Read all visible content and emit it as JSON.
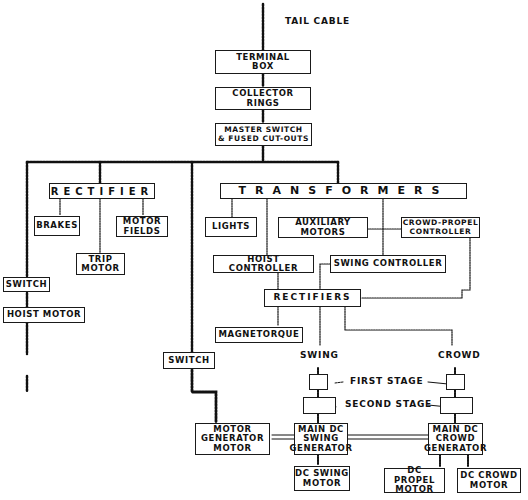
{
  "diagram": {
    "source_label": "TAIL CABLE",
    "nodes": {
      "terminal_box": "TERMINAL\nBOX",
      "collector_rings": "COLLECTOR\nRINGS",
      "master_switch": "MASTER SWITCH\n& FUSED CUT-OUTS",
      "rectifier": "RECTIFIER",
      "brakes": "BRAKES",
      "motor_fields": "MOTOR\nFIELDS",
      "trip_motor": "TRIP\nMOTOR",
      "switch_left": "SWITCH",
      "hoist_motor": "HOIST MOTOR",
      "transformers": "TRANSFORMERS",
      "lights": "LIGHTS",
      "auxiliary_motors": "AUXILIARY\nMOTORS",
      "crowd_propel_controller": "CROWD-PROPEL\nCONTROLLER",
      "hoist_controller": "HOIST CONTROLLER",
      "swing_controller": "SWING CONTROLLER",
      "rectifiers": "RECTIFIERS",
      "magnetorque": "MAGNETORQUE",
      "switch_mid": "SWITCH",
      "motor_generator_motor": "MOTOR\nGENERATOR\nMOTOR",
      "main_dc_swing_generator": "MAIN DC\nSWING\nGENERATOR",
      "main_dc_crowd_generator": "MAIN DC\nCROWD\nGENERATOR",
      "dc_swing_motor": "DC SWING\nMOTOR",
      "dc_propel_motor": "DC PROPEL\nMOTOR",
      "dc_crowd_motor": "DC CROWD\nMOTOR"
    },
    "labels": {
      "swing": "SWING",
      "crowd": "CROWD",
      "first_stage": "FIRST STAGE",
      "second_stage": "SECOND STAGE"
    },
    "edges": [
      [
        "tail_cable",
        "terminal_box"
      ],
      [
        "terminal_box",
        "collector_rings"
      ],
      [
        "collector_rings",
        "master_switch"
      ],
      [
        "master_switch",
        "rectifier"
      ],
      [
        "master_switch",
        "switch_left"
      ],
      [
        "master_switch",
        "switch_mid"
      ],
      [
        "master_switch",
        "transformers"
      ],
      [
        "rectifier",
        "brakes"
      ],
      [
        "rectifier",
        "trip_motor"
      ],
      [
        "rectifier",
        "motor_fields"
      ],
      [
        "switch_left",
        "hoist_motor"
      ],
      [
        "transformers",
        "lights"
      ],
      [
        "transformers",
        "hoist_controller"
      ],
      [
        "transformers",
        "swing_controller"
      ],
      [
        "auxiliary_motors",
        "crowd_propel_controller"
      ],
      [
        "hoist_controller",
        "rectifiers"
      ],
      [
        "swing_controller",
        "rectifiers"
      ],
      [
        "crowd_propel_controller",
        "rectifiers"
      ],
      [
        "rectifiers",
        "magnetorque"
      ],
      [
        "rectifiers",
        "swing_first_stage"
      ],
      [
        "rectifiers",
        "crowd_first_stage"
      ],
      [
        "swing_first_stage",
        "swing_second_stage"
      ],
      [
        "crowd_first_stage",
        "crowd_second_stage"
      ],
      [
        "swing_second_stage",
        "main_dc_swing_generator"
      ],
      [
        "crowd_second_stage",
        "main_dc_crowd_generator"
      ],
      [
        "switch_mid",
        "motor_generator_motor"
      ],
      [
        "motor_generator_motor",
        "main_dc_swing_generator"
      ],
      [
        "main_dc_swing_generator",
        "main_dc_crowd_generator"
      ],
      [
        "main_dc_swing_generator",
        "dc_swing_motor"
      ],
      [
        "main_dc_crowd_generator",
        "dc_propel_motor"
      ],
      [
        "main_dc_crowd_generator",
        "dc_crowd_motor"
      ]
    ]
  }
}
